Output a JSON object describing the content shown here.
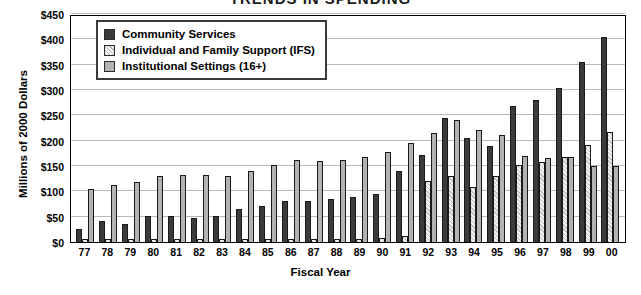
{
  "chart_data": {
    "type": "bar",
    "title": "TRENDS IN SPENDING",
    "xlabel": "Fiscal Year",
    "ylabel": "Millions of 2000 Dollars",
    "ylim": [
      0,
      450
    ],
    "ytick_labels": [
      "$450",
      "$400",
      "$350",
      "$300",
      "$250",
      "$200",
      "$150",
      "$100",
      "$50",
      "$0"
    ],
    "ytick_values": [
      450,
      400,
      350,
      300,
      250,
      200,
      150,
      100,
      50,
      0
    ],
    "grid": true,
    "legend_position": "top-left-inside",
    "categories": [
      "77",
      "78",
      "79",
      "80",
      "81",
      "82",
      "83",
      "84",
      "85",
      "86",
      "87",
      "88",
      "89",
      "90",
      "91",
      "92",
      "93",
      "94",
      "95",
      "96",
      "97",
      "98",
      "99",
      "00"
    ],
    "series": [
      {
        "name": "Community Services",
        "color": "#3b3b3b",
        "values": [
          25,
          42,
          35,
          52,
          52,
          48,
          52,
          66,
          72,
          80,
          80,
          85,
          88,
          95,
          140,
          172,
          245,
          205,
          190,
          268,
          280,
          303,
          355,
          405
        ]
      },
      {
        "name": "Individual and Family Support (IFS)",
        "color": "#ededed",
        "values": [
          5,
          5,
          5,
          5,
          5,
          5,
          5,
          5,
          5,
          5,
          5,
          6,
          6,
          8,
          12,
          120,
          130,
          108,
          130,
          152,
          158,
          168,
          192,
          218
        ]
      },
      {
        "name": "Institutional Settings (16+)",
        "color": "#b3b3b3",
        "values": [
          105,
          112,
          118,
          130,
          132,
          133,
          130,
          140,
          152,
          162,
          160,
          162,
          168,
          178,
          196,
          215,
          240,
          222,
          212,
          170,
          165,
          168,
          150,
          150
        ]
      }
    ]
  },
  "legend": {
    "items": [
      {
        "label": "Community Services",
        "swatch": "cs"
      },
      {
        "label": "Individual and Family Support (IFS)",
        "swatch": "ifs"
      },
      {
        "label": "Institutional Settings (16+)",
        "swatch": "inst"
      }
    ]
  }
}
